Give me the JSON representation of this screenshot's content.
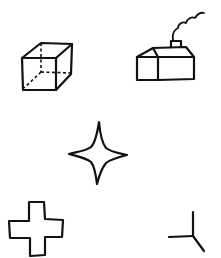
{
  "canvas": {
    "width": 221,
    "height": 258,
    "background": "#ffffff",
    "ink_color": "#111111"
  },
  "figures": [
    {
      "id": "cube",
      "label": "cube",
      "description": "wireframe cube with dashed hidden edges"
    },
    {
      "id": "house",
      "label": "house",
      "description": "house with gabled roof, chimney and smoke"
    },
    {
      "id": "star",
      "label": "four-point-star",
      "description": "four-pointed star outline"
    },
    {
      "id": "cross",
      "label": "cross",
      "description": "plus-shaped cross outline"
    },
    {
      "id": "tripod",
      "label": "three-line-junction",
      "description": "three lines meeting at a point"
    }
  ]
}
